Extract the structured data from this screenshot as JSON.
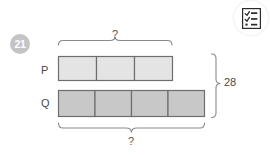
{
  "problem": {
    "number": "21",
    "type": "bar-model"
  },
  "toolbar": {
    "checklist_button_icon": "checklist-icon"
  },
  "diagram": {
    "rows": [
      {
        "label": "P",
        "units": 3,
        "fill": "#e4e4e4",
        "stroke": "#6e6e6e"
      },
      {
        "label": "Q",
        "units": 4,
        "fill": "#c8c8c8",
        "stroke": "#6e6e6e"
      }
    ],
    "braces": [
      {
        "name": "top-brace",
        "label": "?",
        "position": "top",
        "spans": "P"
      },
      {
        "name": "bottom-brace",
        "label": "?",
        "position": "bottom",
        "spans": "Q"
      },
      {
        "name": "right-brace",
        "label": "28",
        "position": "right",
        "spans": "P+Q"
      }
    ],
    "top_question_mark": "?",
    "bottom_question_mark": "?",
    "total_value": "28"
  },
  "colors": {
    "bar_p_fill": "#e4e4e4",
    "bar_q_fill": "#c8c8c8",
    "bar_stroke": "#6e6e6e",
    "brace_stroke": "#8a8a8a",
    "badge_bg": "#c4c4c4",
    "text": "#4a4a4a"
  }
}
